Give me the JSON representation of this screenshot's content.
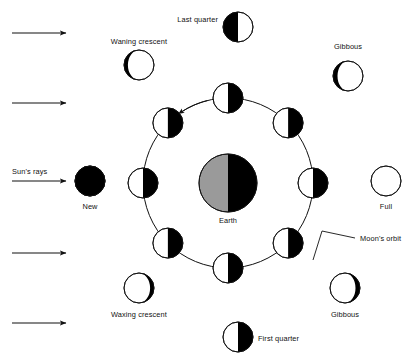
{
  "diagram": {
    "colors": {
      "ink": "#111111",
      "dark_side": "#000000",
      "lit_side": "#ffffff",
      "earth_lit": "#9a9a9a",
      "earth_dark": "#000000",
      "background": "#ffffff"
    },
    "earth": {
      "label": "Earth",
      "cx": 228,
      "cy": 183,
      "r": 29,
      "lit_side": "left",
      "lit_color": "#9a9a9a",
      "dark_color": "#000000"
    },
    "orbit": {
      "label": "Moon's orbit",
      "cx": 228,
      "cy": 183,
      "r": 85,
      "direction": "counterclockwise",
      "direction_arrows": 2
    },
    "sun_rays": {
      "label": "Sun's rays",
      "direction": "left-to-right",
      "arrow_count": 5,
      "arrow_y": [
        33,
        103,
        181,
        253,
        323
      ]
    },
    "orbit_moons": [
      {
        "name": "orbit-moon-new",
        "angle_deg": 180,
        "lit_side": "left",
        "phase": "half-lit-left"
      },
      {
        "name": "orbit-moon-waxing",
        "angle_deg": 135,
        "lit_side": "left",
        "phase": "half-lit-left"
      },
      {
        "name": "orbit-moon-first-quarter",
        "angle_deg": 90,
        "lit_side": "left",
        "phase": "half-lit-left"
      },
      {
        "name": "orbit-moon-waxing-gibbous",
        "angle_deg": 45,
        "lit_side": "left",
        "phase": "half-lit-left"
      },
      {
        "name": "orbit-moon-full",
        "angle_deg": 0,
        "lit_side": "left",
        "phase": "half-lit-left"
      },
      {
        "name": "orbit-moon-waning-gibbous",
        "angle_deg": -45,
        "lit_side": "left",
        "phase": "half-lit-left"
      },
      {
        "name": "orbit-moon-last-quarter",
        "angle_deg": -90,
        "lit_side": "left",
        "phase": "half-lit-left"
      },
      {
        "name": "orbit-moon-waning",
        "angle_deg": -135,
        "lit_side": "left",
        "phase": "half-lit-left"
      }
    ],
    "phase_labels": [
      {
        "key": "new",
        "text": "New",
        "moon_cx": 90,
        "moon_cy": 181,
        "r": 15,
        "phase": "new",
        "label_x": 90,
        "label_y": 209,
        "anchor": "middle"
      },
      {
        "key": "waxing_crescent",
        "text": "Waxing crescent",
        "moon_cx": 139,
        "moon_cy": 288,
        "r": 15,
        "phase": "crescent-left",
        "label_x": 139,
        "label_y": 317,
        "anchor": "middle"
      },
      {
        "key": "first_quarter",
        "text": "First quarter",
        "moon_cx": 238,
        "moon_cy": 337,
        "r": 15,
        "phase": "half-lit-left",
        "label_x": 258,
        "label_y": 341,
        "anchor": "start"
      },
      {
        "key": "waxing_gibbous",
        "text": "Gibbous",
        "moon_cx": 345,
        "moon_cy": 288,
        "r": 15,
        "phase": "gibbous-right",
        "label_x": 345,
        "label_y": 317,
        "anchor": "middle"
      },
      {
        "key": "full",
        "text": "Full",
        "moon_cx": 386,
        "moon_cy": 181,
        "r": 15,
        "phase": "full",
        "label_x": 386,
        "label_y": 209,
        "anchor": "middle"
      },
      {
        "key": "waning_gibbous",
        "text": "Gibbous",
        "moon_cx": 348,
        "moon_cy": 76,
        "r": 15,
        "phase": "gibbous-left",
        "label_x": 348,
        "label_y": 49,
        "anchor": "middle"
      },
      {
        "key": "last_quarter",
        "text": "Last quarter",
        "moon_cx": 238,
        "moon_cy": 27,
        "r": 15,
        "phase": "half-dark-left",
        "label_x": 218,
        "label_y": 22,
        "anchor": "end"
      },
      {
        "key": "waning_crescent",
        "text": "Waning crescent",
        "moon_cx": 139,
        "moon_cy": 65,
        "r": 15,
        "phase": "crescent-right",
        "label_x": 139,
        "label_y": 44,
        "anchor": "middle"
      }
    ],
    "annotations": {
      "moons_orbit_label": "Moon's orbit",
      "moons_orbit_label_x": 360,
      "moons_orbit_label_y": 241,
      "suns_rays_label": "Sun's rays",
      "suns_rays_label_x": 12,
      "suns_rays_label_y": 174
    }
  }
}
